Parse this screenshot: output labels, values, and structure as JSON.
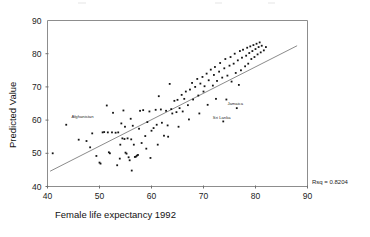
{
  "chart_data": {
    "type": "scatter",
    "title": "",
    "xlabel": "Female life expectancy 1992",
    "ylabel": "Predicted Value",
    "xlim": [
      40,
      90
    ],
    "ylim": [
      40,
      90
    ],
    "xticks": [
      40,
      50,
      60,
      70,
      80,
      90
    ],
    "yticks": [
      40,
      50,
      60,
      70,
      80,
      90
    ],
    "grid": false,
    "legend": "none",
    "annotations": [
      {
        "text": "Rsq = 0.8204",
        "x": 92,
        "y": 41.5,
        "anchor": "start"
      },
      {
        "text": "Afghanistan",
        "x": 44.6,
        "y": 60.6,
        "anchor": "start"
      },
      {
        "text": "Jamaica",
        "x": 74.6,
        "y": 64.4,
        "anchor": "start"
      },
      {
        "text": "Sri Lanka",
        "x": 71.8,
        "y": 60.4,
        "anchor": "start"
      }
    ],
    "fit_line": {
      "x": [
        40.5,
        88.0
      ],
      "y": [
        44.6,
        82.4
      ]
    },
    "series": [
      {
        "name": "Countries",
        "marker": "square",
        "color": "#141414",
        "points": [
          [
            41.0,
            50.0
          ],
          [
            43.6,
            58.6
          ],
          [
            46.0,
            54.1
          ],
          [
            47.5,
            53.7
          ],
          [
            48.2,
            51.8
          ],
          [
            48.6,
            56.0
          ],
          [
            49.4,
            49.2
          ],
          [
            50.2,
            46.9
          ],
          [
            50.6,
            56.3
          ],
          [
            50.9,
            56.4
          ],
          [
            51.4,
            64.4
          ],
          [
            51.6,
            56.3
          ],
          [
            51.8,
            50.3
          ],
          [
            52.0,
            50.0
          ],
          [
            52.4,
            56.3
          ],
          [
            52.6,
            62.2
          ],
          [
            53.1,
            56.2
          ],
          [
            53.6,
            56.3
          ],
          [
            53.9,
            48.4
          ],
          [
            54.0,
            52.6
          ],
          [
            54.2,
            59.0
          ],
          [
            54.4,
            54.5
          ],
          [
            54.6,
            62.9
          ],
          [
            54.8,
            54.3
          ],
          [
            54.9,
            58.0
          ],
          [
            55.0,
            50.2
          ],
          [
            55.2,
            49.9
          ],
          [
            55.4,
            54.5
          ],
          [
            55.6,
            48.8
          ],
          [
            55.8,
            47.9
          ],
          [
            56.0,
            60.4
          ],
          [
            56.1,
            54.2
          ],
          [
            56.4,
            58.3
          ],
          [
            56.6,
            52.6
          ],
          [
            56.8,
            48.9
          ],
          [
            57.0,
            49.0
          ],
          [
            57.2,
            49.3
          ],
          [
            57.4,
            49.5
          ],
          [
            57.6,
            57.4
          ],
          [
            57.8,
            62.8
          ],
          [
            58.1,
            53.1
          ],
          [
            58.4,
            63.0
          ],
          [
            58.8,
            55.2
          ],
          [
            59.0,
            51.4
          ],
          [
            59.2,
            59.4
          ],
          [
            59.6,
            62.6
          ],
          [
            60.0,
            56.8
          ],
          [
            60.4,
            57.6
          ],
          [
            60.8,
            63.1
          ],
          [
            61.0,
            58.6
          ],
          [
            61.4,
            67.2
          ],
          [
            61.8,
            63.2
          ],
          [
            62.0,
            59.2
          ],
          [
            62.4,
            55.3
          ],
          [
            62.8,
            62.8
          ],
          [
            63.1,
            58.4
          ],
          [
            63.5,
            70.9
          ],
          [
            63.8,
            63.3
          ],
          [
            64.0,
            62.0
          ],
          [
            64.4,
            65.8
          ],
          [
            64.8,
            62.4
          ],
          [
            65.0,
            66.1
          ],
          [
            65.4,
            63.6
          ],
          [
            65.8,
            67.6
          ],
          [
            66.0,
            62.6
          ],
          [
            66.3,
            66.4
          ],
          [
            66.6,
            68.6
          ],
          [
            67.0,
            64.5
          ],
          [
            67.4,
            69.2
          ],
          [
            67.8,
            71.2
          ],
          [
            68.0,
            66.2
          ],
          [
            68.4,
            70.0
          ],
          [
            68.8,
            72.4
          ],
          [
            69.0,
            67.4
          ],
          [
            69.4,
            71.0
          ],
          [
            69.8,
            73.0
          ],
          [
            70.0,
            68.6
          ],
          [
            70.2,
            70.2
          ],
          [
            70.6,
            74.0
          ],
          [
            71.0,
            72.0
          ],
          [
            71.4,
            75.2
          ],
          [
            71.8,
            70.4
          ],
          [
            72.0,
            73.6
          ],
          [
            72.2,
            76.0
          ],
          [
            72.6,
            71.8
          ],
          [
            73.0,
            74.6
          ],
          [
            73.2,
            77.2
          ],
          [
            73.6,
            72.8
          ],
          [
            74.0,
            75.6
          ],
          [
            74.2,
            78.4
          ],
          [
            74.4,
            66.2
          ],
          [
            74.6,
            73.4
          ],
          [
            75.0,
            76.4
          ],
          [
            75.2,
            79.0
          ],
          [
            75.4,
            71.6
          ],
          [
            75.8,
            77.0
          ],
          [
            76.0,
            80.0
          ],
          [
            76.2,
            74.2
          ],
          [
            76.4,
            63.6
          ],
          [
            76.6,
            78.0
          ],
          [
            77.0,
            80.8
          ],
          [
            77.2,
            75.0
          ],
          [
            77.4,
            78.8
          ],
          [
            77.6,
            81.2
          ],
          [
            78.0,
            76.2
          ],
          [
            78.2,
            79.4
          ],
          [
            78.4,
            81.8
          ],
          [
            78.6,
            77.0
          ],
          [
            78.8,
            80.2
          ],
          [
            79.0,
            82.2
          ],
          [
            79.2,
            78.4
          ],
          [
            79.4,
            80.8
          ],
          [
            79.6,
            82.6
          ],
          [
            79.8,
            79.0
          ],
          [
            80.0,
            81.4
          ],
          [
            80.2,
            83.0
          ],
          [
            80.4,
            79.8
          ],
          [
            80.6,
            82.0
          ],
          [
            80.8,
            83.4
          ],
          [
            81.0,
            80.4
          ],
          [
            81.2,
            82.4
          ],
          [
            81.6,
            81.0
          ],
          [
            82.0,
            82.0
          ],
          [
            73.8,
            59.6
          ],
          [
            70.8,
            64.6
          ],
          [
            67.2,
            60.2
          ],
          [
            63.2,
            55.0
          ],
          [
            59.8,
            48.6
          ],
          [
            56.2,
            44.8
          ],
          [
            53.4,
            46.4
          ],
          [
            50.0,
            47.2
          ],
          [
            61.2,
            52.6
          ],
          [
            65.2,
            58.0
          ],
          [
            69.2,
            62.0
          ],
          [
            72.4,
            66.4
          ],
          [
            76.8,
            70.6
          ]
        ]
      }
    ]
  },
  "axis": {
    "x_title": "Female life expectancy 1992",
    "y_title": "Predicted Value"
  }
}
